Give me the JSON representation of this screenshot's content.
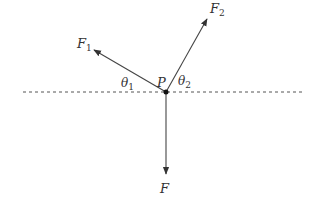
{
  "diagram": {
    "type": "force-diagram",
    "colors": {
      "line": "#444444",
      "text": "#333333",
      "dash": "#555555"
    },
    "point": {
      "label": "P",
      "x": 166,
      "y": 92
    },
    "reference_line": {
      "x1": 23,
      "x2": 305,
      "y": 92,
      "style": "dashed"
    },
    "forces": [
      {
        "id": "F1",
        "label": "F",
        "subscript": "1",
        "tip_x": 94,
        "tip_y": 50,
        "label_x": 77,
        "label_y": 48
      },
      {
        "id": "F2",
        "label": "F",
        "subscript": "2",
        "tip_x": 207,
        "tip_y": 19,
        "label_x": 210,
        "label_y": 13
      },
      {
        "id": "F",
        "label": "F",
        "subscript": "",
        "tip_x": 166,
        "tip_y": 174,
        "label_x": 160,
        "label_y": 193
      }
    ],
    "angles": [
      {
        "id": "theta1",
        "label": "θ",
        "subscript": "1",
        "x": 121,
        "y": 87
      },
      {
        "id": "theta2",
        "label": "θ",
        "subscript": "2",
        "x": 178,
        "y": 85
      }
    ]
  }
}
